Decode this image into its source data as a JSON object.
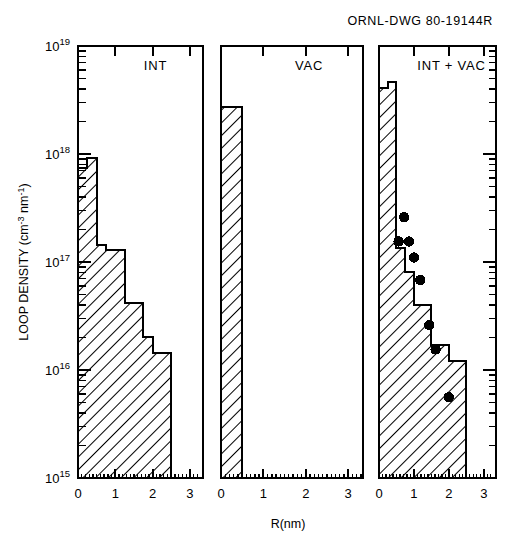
{
  "figure": {
    "drawing_number": "ORNL-DWG 80-19144R",
    "xlabel": "R(nm)",
    "ylabel_main": "LOOP DENSITY",
    "ylabel_units": "(cm",
    "ylabel_unit_exp1": "-3",
    "ylabel_unit_mid": " nm",
    "ylabel_unit_exp2": "-1",
    "ylabel_unit_close": ")",
    "ylabel_full": "LOOP DENSITY (cm-3 nm-1)",
    "background": "#ffffff",
    "ink": "#000000"
  },
  "chart_data": {
    "type": "bar",
    "title": "ORNL-DWG 80-19144R",
    "xlabel": "R(nm)",
    "ylabel": "LOOP DENSITY (cm^-3 nm^-1)",
    "xlim": [
      0,
      3.35
    ],
    "ylim": [
      1000000000000000.0,
      1e+19
    ],
    "yscale": "log",
    "xscale": "linear",
    "grid": false,
    "legend": "none",
    "x_ticks": [
      0,
      1,
      2,
      3
    ],
    "x_tick_labels": [
      "0",
      "1",
      "2",
      "3"
    ],
    "y_ticks": [
      1000000000000000.0,
      1e+16,
      1e+17,
      1e+18,
      1e+19
    ],
    "y_tick_labels": [
      "10^15",
      "10^16",
      "10^17",
      "10^18",
      "10^19"
    ],
    "y_tick_label_bases": [
      "10",
      "10",
      "10",
      "10",
      "10"
    ],
    "y_tick_label_exps": [
      "15",
      "16",
      "17",
      "18",
      "19"
    ],
    "panels": [
      {
        "id": "int",
        "label": "INT",
        "bin_width": 0.25,
        "histogram": [
          {
            "x0": 0.0,
            "x1": 0.25,
            "y": 7.4e+17
          },
          {
            "x0": 0.25,
            "x1": 0.5,
            "y": 9.2e+17
          },
          {
            "x0": 0.5,
            "x1": 0.75,
            "y": 1.45e+17
          },
          {
            "x0": 0.75,
            "x1": 1.0,
            "y": 1.3e+17
          },
          {
            "x0": 1.0,
            "x1": 1.25,
            "y": 1.3e+17
          },
          {
            "x0": 1.25,
            "x1": 1.5,
            "y": 4.2e+16
          },
          {
            "x0": 1.5,
            "x1": 1.75,
            "y": 4.2e+16
          },
          {
            "x0": 1.75,
            "x1": 2.0,
            "y": 2e+16
          },
          {
            "x0": 2.0,
            "x1": 2.5,
            "y": 1.45e+16
          }
        ],
        "points": []
      },
      {
        "id": "vac",
        "label": "VAC",
        "bin_width": 0.5,
        "histogram": [
          {
            "x0": 0.0,
            "x1": 0.5,
            "y": 2.7e+18
          }
        ],
        "points": []
      },
      {
        "id": "int_vac",
        "label": "INT + VAC",
        "bin_width": 0.25,
        "histogram": [
          {
            "x0": 0.0,
            "x1": 0.25,
            "y": 4.1e+18
          },
          {
            "x0": 0.25,
            "x1": 0.5,
            "y": 4.6e+18
          },
          {
            "x0": 0.5,
            "x1": 0.75,
            "y": 1.35e+17
          },
          {
            "x0": 0.75,
            "x1": 1.0,
            "y": 8e+16
          },
          {
            "x0": 1.0,
            "x1": 1.25,
            "y": 4e+16
          },
          {
            "x0": 1.25,
            "x1": 1.5,
            "y": 4e+16
          },
          {
            "x0": 1.5,
            "x1": 1.75,
            "y": 1.7e+16
          },
          {
            "x0": 1.75,
            "x1": 2.0,
            "y": 1.7e+16
          },
          {
            "x0": 2.0,
            "x1": 2.5,
            "y": 1.2e+16
          }
        ],
        "points": [
          {
            "x": 0.72,
            "y": 2.6e+17
          },
          {
            "x": 0.56,
            "y": 1.55e+17
          },
          {
            "x": 0.86,
            "y": 1.55e+17
          },
          {
            "x": 1.0,
            "y": 1.1e+17
          },
          {
            "x": 1.18,
            "y": 6.8e+16
          },
          {
            "x": 1.44,
            "y": 2.6e+16
          },
          {
            "x": 1.62,
            "y": 1.55e+16
          },
          {
            "x": 2.0,
            "y": 5600000000000000.0
          }
        ],
        "point_marker": "filled-circle",
        "point_color": "#000000"
      }
    ]
  }
}
